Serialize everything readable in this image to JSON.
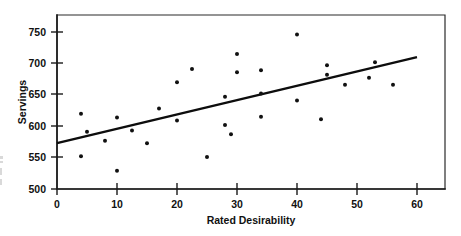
{
  "chart_data": {
    "type": "scatter",
    "title": "",
    "xlabel": "Rated Desirability",
    "ylabel": "Servings",
    "xlim": [
      0,
      60
    ],
    "ylim": [
      500,
      750
    ],
    "xticks": [
      0,
      10,
      20,
      30,
      40,
      50,
      60
    ],
    "yticks": [
      500,
      550,
      600,
      650,
      700,
      750
    ],
    "xtick_labels": [
      "0",
      "10",
      "20",
      "30",
      "40",
      "50",
      "60"
    ],
    "ytick_labels": [
      "500",
      "550",
      "600",
      "650",
      "700",
      "750"
    ],
    "grid": false,
    "legend": null,
    "frame": "box",
    "points": [
      {
        "x": 4,
        "y": 620
      },
      {
        "x": 4,
        "y": 552
      },
      {
        "x": 5,
        "y": 591
      },
      {
        "x": 8,
        "y": 577
      },
      {
        "x": 10,
        "y": 614
      },
      {
        "x": 10,
        "y": 529
      },
      {
        "x": 12.5,
        "y": 593
      },
      {
        "x": 15,
        "y": 573
      },
      {
        "x": 17,
        "y": 628
      },
      {
        "x": 20,
        "y": 670
      },
      {
        "x": 20,
        "y": 609
      },
      {
        "x": 22.5,
        "y": 691
      },
      {
        "x": 25,
        "y": 551
      },
      {
        "x": 28,
        "y": 647
      },
      {
        "x": 28,
        "y": 602
      },
      {
        "x": 29,
        "y": 587
      },
      {
        "x": 30,
        "y": 715
      },
      {
        "x": 30,
        "y": 686
      },
      {
        "x": 34,
        "y": 689
      },
      {
        "x": 34,
        "y": 652
      },
      {
        "x": 34,
        "y": 615
      },
      {
        "x": 40,
        "y": 746
      },
      {
        "x": 40,
        "y": 641
      },
      {
        "x": 44,
        "y": 611
      },
      {
        "x": 45,
        "y": 697
      },
      {
        "x": 45,
        "y": 682
      },
      {
        "x": 48,
        "y": 666
      },
      {
        "x": 52,
        "y": 677
      },
      {
        "x": 53,
        "y": 702
      },
      {
        "x": 56,
        "y": 666
      }
    ],
    "trend_line": {
      "type": "linear-regression",
      "x_start": 0,
      "y_start": 573,
      "x_end": 60,
      "y_end": 710
    }
  },
  "axes": {
    "x_title": "Rated Desirability",
    "y_title": "Servings"
  }
}
